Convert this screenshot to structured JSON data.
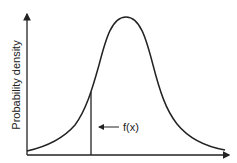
{
  "diagram": {
    "type": "normal-distribution-curve",
    "y_axis_label": "Probability density",
    "annotation_label": "f(x)",
    "colors": {
      "stroke": "#222222",
      "background": "#ffffff"
    }
  }
}
